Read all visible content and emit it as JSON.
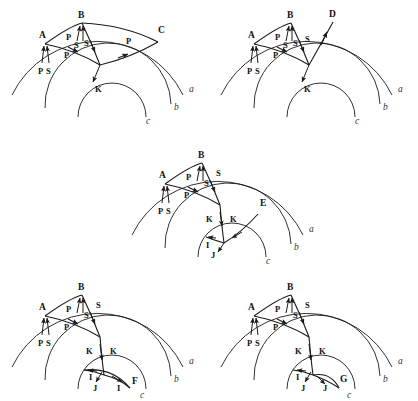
{
  "figure": {
    "kind": "seismic-ray-path-diagram",
    "background_color": "#ffffff",
    "stroke_color": "#1a1a1a",
    "label_color": "#111111",
    "layer_label_color": "#333333",
    "width": 418,
    "height": 401
  },
  "layers": {
    "surface_label": "a",
    "outer_core_label": "b",
    "inner_core_label": "c"
  },
  "panels": [
    {
      "id": "panel-1",
      "station_labels": [
        "A",
        "B",
        "C"
      ],
      "phase_labels": [
        "P",
        "S",
        "P",
        "S",
        "P",
        "S",
        "P",
        "S",
        "K"
      ],
      "layer_labels": [
        "a",
        "b",
        "c"
      ]
    },
    {
      "id": "panel-2",
      "station_labels": [
        "A",
        "B",
        "D"
      ],
      "phase_labels": [
        "P",
        "S",
        "P",
        "S",
        "S",
        "S",
        "P",
        "K"
      ],
      "layer_labels": [
        "a",
        "b",
        "c"
      ]
    },
    {
      "id": "panel-3",
      "station_labels": [
        "A",
        "B",
        "E"
      ],
      "phase_labels": [
        "P",
        "S",
        "P",
        "S",
        "S",
        "P",
        "K",
        "K",
        "I",
        "J"
      ],
      "layer_labels": [
        "a",
        "b",
        "c"
      ]
    },
    {
      "id": "panel-4",
      "station_labels": [
        "A",
        "B",
        "F"
      ],
      "phase_labels": [
        "P",
        "S",
        "P",
        "S",
        "S",
        "P",
        "K",
        "K",
        "I",
        "J",
        "I"
      ],
      "layer_labels": [
        "a",
        "b",
        "c"
      ]
    },
    {
      "id": "panel-5",
      "station_labels": [
        "A",
        "B",
        "G"
      ],
      "phase_labels": [
        "P",
        "S",
        "P",
        "S",
        "S",
        "P",
        "K",
        "K",
        "I",
        "J",
        "J"
      ],
      "layer_labels": [
        "a",
        "b",
        "c"
      ]
    }
  ],
  "text": {
    "A": "A",
    "B": "B",
    "C": "C",
    "D": "D",
    "E": "E",
    "F": "F",
    "G": "G",
    "P": "P",
    "S": "S",
    "K": "K",
    "I": "I",
    "J": "J",
    "a": "a",
    "b": "b",
    "c": "c"
  }
}
